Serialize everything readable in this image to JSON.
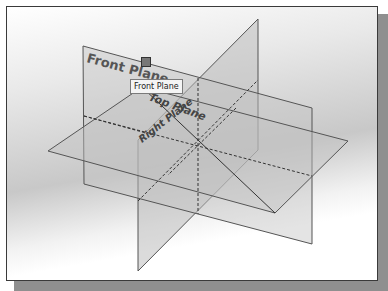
{
  "viewport": {
    "planes": [
      {
        "name": "Front Plane",
        "label": "Front Plane"
      },
      {
        "name": "Top Plane",
        "label": "Top Plane"
      },
      {
        "name": "Right Plane",
        "label": "Right Plane"
      }
    ],
    "tooltip": {
      "text": "Front Plane"
    },
    "cursor_icon": "selection-cursor-icon"
  },
  "colors": {
    "plane_fill": "#b9b9b9",
    "plane_edge": "#555555",
    "frame_border": "#3a3a3a"
  }
}
